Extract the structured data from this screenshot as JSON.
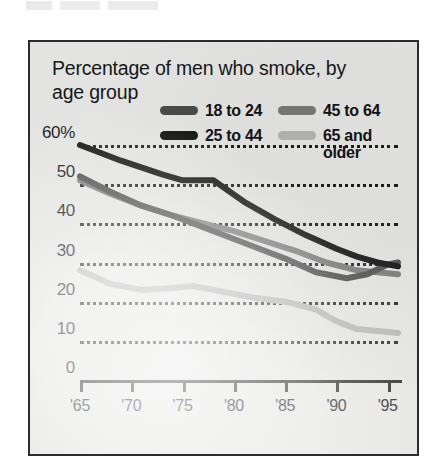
{
  "chart_data": {
    "type": "line",
    "title": "Percentage of men who smoke, by age group",
    "xlabel": "",
    "ylabel": "",
    "ylim": [
      0,
      60
    ],
    "xlim": [
      1965,
      1996
    ],
    "grid": true,
    "legend_position": "top",
    "y_ticks": [
      "60%",
      "50",
      "40",
      "30",
      "20",
      "10",
      "0"
    ],
    "y_tick_values": [
      60,
      50,
      40,
      30,
      20,
      10,
      0
    ],
    "x_ticks": [
      "'65",
      "'70",
      "'75",
      "'80",
      "'85",
      "'90",
      "'95"
    ],
    "x_tick_values": [
      1965,
      1970,
      1975,
      1980,
      1985,
      1990,
      1995
    ],
    "series": [
      {
        "name": "18 to 24",
        "color": "#4a4a4a",
        "x": [
          1965,
          1968,
          1971,
          1974,
          1977,
          1980,
          1983,
          1985,
          1988,
          1991,
          1993,
          1995,
          1996
        ],
        "values": [
          52,
          48,
          44.5,
          42,
          39,
          36,
          33,
          31,
          27.5,
          26,
          27,
          29.5,
          30
        ]
      },
      {
        "name": "25 to 44",
        "color": "#111111",
        "x": [
          1965,
          1969,
          1973,
          1975,
          1978,
          1981,
          1984,
          1987,
          1990,
          1992,
          1994,
          1996
        ],
        "values": [
          60,
          56,
          52.5,
          51,
          51,
          45.5,
          41,
          37,
          33.5,
          31.5,
          30,
          29
        ]
      },
      {
        "name": "45 to 64",
        "color": "#787878",
        "x": [
          1965,
          1968,
          1971,
          1974,
          1977,
          1980,
          1983,
          1986,
          1989,
          1992,
          1994,
          1996
        ],
        "values": [
          51,
          47.5,
          44.5,
          42,
          40,
          38,
          35.5,
          33,
          30,
          28,
          27.5,
          27
        ]
      },
      {
        "name": "65 and older",
        "color": "#b3b3b3",
        "x": [
          1965,
          1968,
          1971,
          1974,
          1976,
          1979,
          1982,
          1985,
          1988,
          1990,
          1992,
          1994,
          1996
        ],
        "values": [
          28,
          24.5,
          23,
          23.5,
          24,
          22.5,
          21,
          20,
          18,
          15,
          13,
          12.5,
          12
        ]
      }
    ]
  },
  "legend": {
    "items": [
      {
        "label": "18 to 24",
        "color": "#4a4a4a"
      },
      {
        "label": "45 to 64",
        "color": "#787878"
      },
      {
        "label": "25 to 44",
        "color": "#111111"
      },
      {
        "label": "65 and\nolder",
        "color": "#b3b3b3"
      }
    ]
  }
}
